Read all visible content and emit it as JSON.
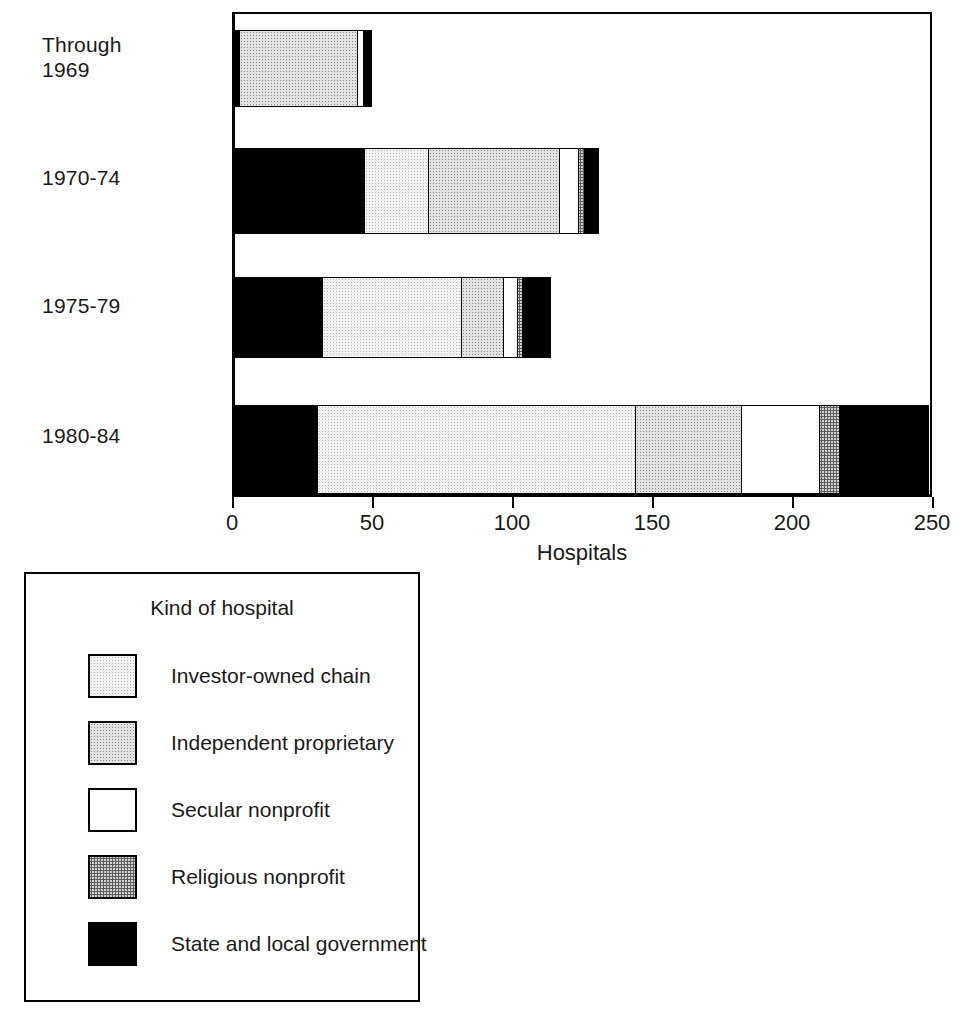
{
  "chart_data": {
    "type": "bar",
    "orientation": "horizontal",
    "stacked": true,
    "title": "",
    "xlabel": "Hospitals",
    "ylabel": "",
    "xlim": [
      0,
      250
    ],
    "xticks": [
      0,
      50,
      100,
      150,
      200,
      250
    ],
    "xtick_labels": [
      "0",
      "50",
      "100",
      "150",
      "200",
      "250"
    ],
    "grid": false,
    "legend_position": "below-left",
    "legend_title": "Kind of hospital",
    "categories": [
      "Through\n1969",
      "1970-74",
      "1975-79",
      "1980-84"
    ],
    "series": [
      {
        "name": "State and local government (left)",
        "key": "government",
        "values": [
          2,
          47,
          32,
          30
        ]
      },
      {
        "name": "Investor-owned chain",
        "key": "investor",
        "values": [
          0,
          23,
          50,
          114
        ]
      },
      {
        "name": "Independent proprietary",
        "key": "independent",
        "values": [
          43,
          47,
          15,
          38
        ]
      },
      {
        "name": "Secular nonprofit",
        "key": "secular",
        "values": [
          2,
          7,
          5,
          28
        ]
      },
      {
        "name": "Religious nonprofit",
        "key": "religious",
        "values": [
          0,
          2,
          2,
          7
        ]
      },
      {
        "name": "State and local government (right)",
        "key": "government",
        "values": [
          3,
          5,
          10,
          32
        ]
      }
    ],
    "totals": [
      50,
      131,
      114,
      249
    ]
  },
  "axis": {
    "x_title": "Hospitals",
    "ticks": [
      "0",
      "50",
      "100",
      "150",
      "200",
      "250"
    ]
  },
  "categories": [
    {
      "label": "Through\n1969"
    },
    {
      "label": "1970-74"
    },
    {
      "label": "1975-79"
    },
    {
      "label": "1980-84"
    }
  ],
  "legend": {
    "title": "Kind of hospital",
    "items": [
      {
        "label": "Investor-owned chain",
        "key": "investor",
        "color": "#f2f2f2"
      },
      {
        "label": "Independent proprietary",
        "key": "independent",
        "color": "#e2e2e2"
      },
      {
        "label": "Secular nonprofit",
        "key": "secular",
        "color": "#ffffff"
      },
      {
        "label": "Religious nonprofit",
        "key": "religious",
        "color": "#d2d2d2"
      },
      {
        "label": "State and local government",
        "key": "government",
        "color": "#000000"
      }
    ]
  }
}
